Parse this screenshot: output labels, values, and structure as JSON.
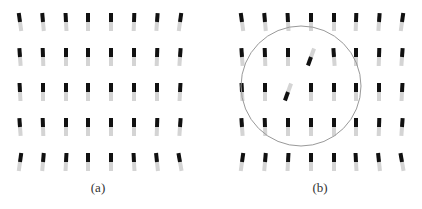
{
  "figure": {
    "panels": [
      {
        "id": "a",
        "caption": "(a)",
        "column_x": [
          18,
          41,
          64,
          86,
          109,
          132,
          155,
          178
        ],
        "row_y": [
          13,
          48,
          83,
          118,
          153
        ],
        "tilts": [
          [
            -8,
            -5,
            -3,
            0,
            0,
            2,
            4,
            8
          ],
          [
            -4,
            -2,
            0,
            0,
            0,
            0,
            2,
            4
          ],
          [
            -3,
            0,
            0,
            0,
            0,
            0,
            0,
            3
          ],
          [
            -4,
            -2,
            0,
            0,
            0,
            0,
            2,
            4
          ],
          [
            8,
            5,
            3,
            0,
            0,
            -3,
            -6,
            -10
          ]
        ],
        "flipped": []
      },
      {
        "id": "b",
        "caption": "(b)",
        "column_x": [
          240,
          263,
          286,
          309,
          332,
          354,
          377,
          400
        ],
        "row_y": [
          13,
          48,
          83,
          118,
          153
        ],
        "tilts": [
          [
            -8,
            -5,
            -3,
            0,
            0,
            2,
            4,
            8
          ],
          [
            -4,
            -2,
            0,
            20,
            -4,
            0,
            2,
            4
          ],
          [
            -3,
            0,
            20,
            0,
            0,
            0,
            0,
            3
          ],
          [
            -4,
            -2,
            0,
            0,
            0,
            0,
            2,
            4
          ],
          [
            8,
            5,
            3,
            0,
            0,
            -3,
            -6,
            -10
          ]
        ],
        "flipped": [
          [
            1,
            3
          ],
          [
            2,
            2
          ]
        ],
        "circle": {
          "cx": 301,
          "cy": 86,
          "r": 60,
          "stroke": "#999999"
        }
      }
    ],
    "element": {
      "width": 4,
      "dark_height": 9,
      "light_height": 9,
      "dark_color": "#111111",
      "light_color": "#d4d4d4"
    }
  }
}
